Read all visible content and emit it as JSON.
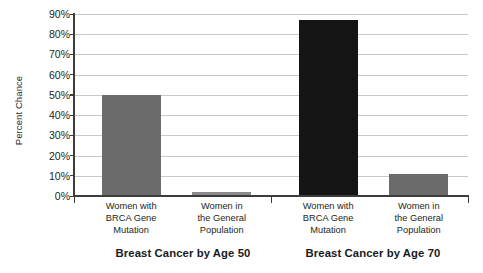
{
  "chart_data": {
    "type": "bar",
    "title": "",
    "subtitle": "",
    "xlabel": "",
    "ylabel": "Percent Chance",
    "ylim": [
      0,
      90
    ],
    "ytick_labels": [
      "0%",
      "10%",
      "20%",
      "30%",
      "40%",
      "50%",
      "60%",
      "70%",
      "80%",
      "90%"
    ],
    "ytick_values": [
      0,
      10,
      20,
      30,
      40,
      50,
      60,
      70,
      80,
      90
    ],
    "grid": true,
    "legend": "none",
    "categories": [
      "Women with BRCA Gene Mutation",
      "Women in the General Population",
      "Women with BRCA Gene Mutation",
      "Women in the General Population"
    ],
    "values": [
      50,
      2,
      87,
      11
    ],
    "groups": [
      {
        "title": "Breast Cancer by Age 50",
        "bars": [
          {
            "label_lines": [
              "Women with",
              "BRCA Gene",
              "Mutation"
            ],
            "value": 50,
            "color": "#6b6b6b"
          },
          {
            "label_lines": [
              "Women in",
              "the General",
              "Population"
            ],
            "value": 2,
            "color": "#8a8a8a"
          }
        ]
      },
      {
        "title": "Breast Cancer by Age 70",
        "bars": [
          {
            "label_lines": [
              "Women with",
              "BRCA Gene",
              "Mutation"
            ],
            "value": 87,
            "color": "#141414"
          },
          {
            "label_lines": [
              "Women in",
              "the General",
              "Population"
            ],
            "value": 11,
            "color": "#6b6b6b"
          }
        ]
      }
    ],
    "colors": {
      "bar_gray": "#6b6b6b",
      "bar_light_gray": "#8a8a8a",
      "bar_dark": "#141414",
      "gridline": "#c9c9c9",
      "axis": "#3c3c3c",
      "background": "#ffffff",
      "text": "#231f20"
    }
  }
}
